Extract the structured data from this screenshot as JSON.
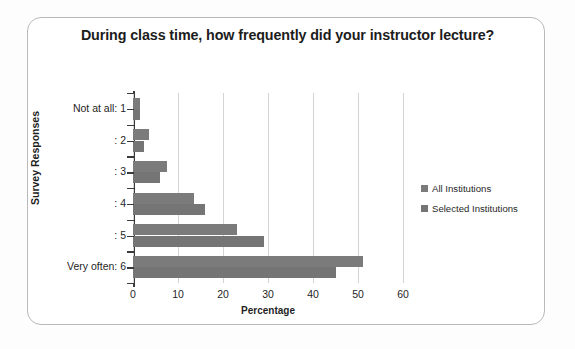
{
  "chart_data": {
    "type": "bar",
    "orientation": "horizontal",
    "title": "During class time, how frequently did your instructor lecture?",
    "xlabel": "Percentage",
    "ylabel": "Survey Responses",
    "categories": [
      "Not at all: 1",
      ": 2",
      ": 3",
      ": 4",
      ": 5",
      "Very often: 6"
    ],
    "series": [
      {
        "name": "All Institutions",
        "color": "#7b7b7b",
        "values": [
          1.5,
          3.5,
          7.5,
          13.5,
          23,
          51
        ]
      },
      {
        "name": "Selected Institutions",
        "color": "#757575",
        "values": [
          1.5,
          2.5,
          6,
          16,
          29,
          45
        ]
      }
    ],
    "xlim": [
      0,
      60
    ],
    "xticks": [
      0,
      10,
      20,
      30,
      40,
      50,
      60
    ],
    "grid": true,
    "legend_position": "right"
  },
  "legend": {
    "items": [
      {
        "label": "All Institutions"
      },
      {
        "label": "Selected Institutions"
      }
    ]
  },
  "colors": {
    "bar_all": "#7b7b7b",
    "bar_selected": "#757575",
    "frame_border": "#b9b9b9",
    "gridline": "#d4d4d4",
    "axis": "#3a3a3a",
    "text": "#1f1f1f",
    "background": "#ffffff"
  }
}
